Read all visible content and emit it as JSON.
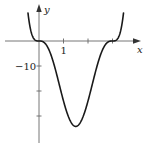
{
  "chart_data": {
    "type": "line",
    "title": "",
    "xlabel": "x",
    "ylabel": "y",
    "function_description": "y ≈ 3·x³·(x−3)³",
    "x_ticks": [
      1,
      2,
      3
    ],
    "x_tick_labels": [
      "1"
    ],
    "y_ticks": [
      -10,
      -20,
      -30
    ],
    "y_tick_labels": [
      "−10"
    ],
    "xlim": [
      -1.4,
      4.1
    ],
    "ylim": [
      -41,
      16
    ],
    "grid": false,
    "legend": null,
    "key_points": [
      {
        "x": 0,
        "y": 0,
        "note": "zero (flat inflection)"
      },
      {
        "x": 1.5,
        "y": -34.2,
        "note": "minimum"
      },
      {
        "x": 3,
        "y": 0,
        "note": "zero (flat inflection)"
      }
    ],
    "x": [
      -0.45,
      -0.3,
      -0.15,
      0,
      0.25,
      0.5,
      0.75,
      1.0,
      1.25,
      1.5,
      1.75,
      2.0,
      2.25,
      2.5,
      2.75,
      3.0,
      3.15,
      3.3,
      3.45
    ],
    "series": [
      {
        "name": "f(x)",
        "values": [
          10.5,
          2.0,
          0.3,
          0,
          -0.8,
          -5.9,
          -16.0,
          -24.0,
          -31.0,
          -34.2,
          -31.0,
          -24.0,
          -16.0,
          -5.9,
          -0.8,
          0,
          0.3,
          2.0,
          10.5
        ]
      }
    ]
  },
  "labels": {
    "y_axis": "y",
    "x_axis": "x",
    "x_tick_1": "1",
    "y_tick_neg10": "−10"
  },
  "colors": {
    "curve": "#1a1a1a",
    "axis": "#555555"
  }
}
